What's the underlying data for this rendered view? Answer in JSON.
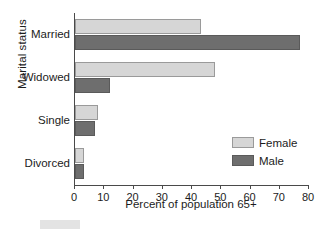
{
  "chart_data": {
    "type": "bar",
    "orientation": "horizontal",
    "title": "",
    "xlabel": "Percent of population 65+",
    "ylabel": "Marital status",
    "categories": [
      "Married",
      "Widowed",
      "Single",
      "Divorced"
    ],
    "series": [
      {
        "name": "Female",
        "color": "#d6d6d6",
        "values": [
          43,
          48,
          8,
          3
        ]
      },
      {
        "name": "Male",
        "color": "#6e6e6e",
        "values": [
          77,
          12,
          7,
          3
        ]
      }
    ],
    "xlim": [
      0,
      80
    ],
    "xticks": [
      0,
      10,
      20,
      30,
      40,
      50,
      60,
      70,
      80
    ],
    "xtick_labels": [
      "0",
      "10",
      "20",
      "30",
      "40",
      "50",
      "60",
      "70",
      "80"
    ],
    "grid": false,
    "legend_position": "middle-right",
    "legend_entries": [
      "Female",
      "Male"
    ]
  }
}
